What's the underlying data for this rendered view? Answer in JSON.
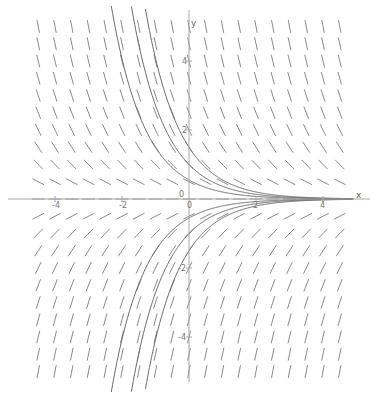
{
  "chart_data": {
    "type": "line",
    "title": "",
    "subtitle": "Slope field of dy/dx = -y with solution curves y = C·e^(-x)",
    "xlabel": "x",
    "ylabel": "y",
    "xlim": [
      -5.4,
      5.0
    ],
    "ylim": [
      -5.6,
      5.5
    ],
    "grid": false,
    "x_ticks": [
      -4,
      -2,
      0,
      2,
      4
    ],
    "y_ticks": [
      4,
      2,
      -2,
      -4
    ],
    "x_tick_labels": [
      "-4",
      "-2",
      "0",
      "2",
      "4"
    ],
    "y_tick_labels": [
      "4",
      "2",
      "-2",
      "-4"
    ],
    "origin_label": "0",
    "slope_field": {
      "equation": "dy/dx = -y",
      "x_start": -4.5,
      "x_end": 4.5,
      "x_step": 0.5,
      "y_start": -5.0,
      "y_end": 5.0,
      "y_step": 0.5
    },
    "series": [
      {
        "name": "C=1.5",
        "C": 1.5
      },
      {
        "name": "C=1",
        "C": 1.0
      },
      {
        "name": "C=0.55",
        "C": 0.55
      },
      {
        "name": "C=-0.55",
        "C": -0.55
      },
      {
        "name": "C=-1",
        "C": -1.0
      },
      {
        "name": "C=-1.5",
        "C": -1.5
      }
    ],
    "colors": {
      "slope_mark": "#8a8a8a",
      "curve": "#6a6a6a",
      "axis": "#a8a8a8"
    }
  }
}
